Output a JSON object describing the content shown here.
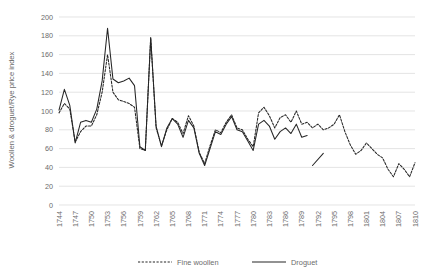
{
  "chart_data": {
    "type": "line",
    "title": "",
    "xlabel": "",
    "ylabel": "Woollen & droguet/Rye price index",
    "ylim": [
      0,
      200
    ],
    "ytick_step": 20,
    "yticks": [
      "0",
      "20",
      "40",
      "60",
      "80",
      "100",
      "120",
      "140",
      "160",
      "180",
      "200"
    ],
    "grid": true,
    "xlim": [
      1744,
      1810
    ],
    "xtick_step": 3,
    "xticks": [
      "1744",
      "1747",
      "1750",
      "1753",
      "1756",
      "1759",
      "1762",
      "1765",
      "1768",
      "1771",
      "1774",
      "1777",
      "1780",
      "1783",
      "1786",
      "1789",
      "1792",
      "1795",
      "1798",
      "1801",
      "1804",
      "1807",
      "1810"
    ],
    "legend_position": "bottom",
    "legend": [
      "Fine woollen",
      "Droguet"
    ],
    "series": [
      {
        "name": "Fine woollen",
        "style": "dashed",
        "color": "#262626",
        "x": [
          1744,
          1745,
          1746,
          1747,
          1748,
          1749,
          1750,
          1751,
          1752,
          1753,
          1754,
          1755,
          1756,
          1757,
          1758,
          1759,
          1760,
          1761,
          1762,
          1763,
          1764,
          1765,
          1766,
          1767,
          1768,
          1769,
          1770,
          1771,
          1772,
          1773,
          1774,
          1775,
          1776,
          1777,
          1778,
          1779,
          1780,
          1781,
          1782,
          1783,
          1784,
          1785,
          1786,
          1787,
          1788,
          1789,
          1790,
          1791,
          1792,
          1793,
          1794,
          1795,
          1796,
          1797,
          1798,
          1799,
          1800,
          1801,
          1802,
          1803,
          1804,
          1805,
          1806,
          1807,
          1808,
          1809,
          1810
        ],
        "values": [
          98,
          108,
          102,
          67,
          78,
          84,
          84,
          96,
          120,
          160,
          120,
          112,
          110,
          108,
          104,
          60,
          58,
          178,
          82,
          63,
          80,
          92,
          88,
          76,
          95,
          84,
          56,
          44,
          63,
          80,
          77,
          88,
          96,
          82,
          80,
          70,
          62,
          98,
          104,
          95,
          82,
          93,
          96,
          88,
          100,
          86,
          88,
          82,
          86,
          80,
          82,
          86,
          96,
          78,
          64,
          54,
          58,
          66,
          60,
          54,
          50,
          38,
          30,
          44,
          38,
          30,
          45
        ]
      },
      {
        "name": "Droguet",
        "style": "solid",
        "color": "#262626",
        "x": [
          1744,
          1745,
          1746,
          1747,
          1748,
          1749,
          1750,
          1751,
          1752,
          1753,
          1754,
          1755,
          1756,
          1757,
          1758,
          1759,
          1760,
          1761,
          1762,
          1763,
          1764,
          1765,
          1766,
          1767,
          1768,
          1769,
          1770,
          1771,
          1772,
          1773,
          1774,
          1775,
          1776,
          1777,
          1778,
          1779,
          1780,
          1781,
          1782,
          1783,
          1784,
          1785,
          1786,
          1787,
          1788,
          1789,
          1790
        ],
        "values": [
          101,
          123,
          106,
          66,
          88,
          90,
          88,
          102,
          132,
          188,
          134,
          130,
          132,
          135,
          127,
          62,
          58,
          178,
          84,
          62,
          82,
          92,
          86,
          72,
          90,
          82,
          55,
          42,
          60,
          78,
          75,
          86,
          94,
          80,
          78,
          68,
          58,
          86,
          90,
          84,
          70,
          78,
          82,
          76,
          86,
          72,
          74
        ],
        "gap_after": 1789,
        "post_gap_segment": {
          "x": [
            1791,
            1793
          ],
          "values": [
            42,
            55
          ]
        }
      }
    ]
  },
  "axis": {
    "y_title": "Woollen & droguet/Rye price index"
  },
  "legend_items": [
    {
      "label": "Fine woollen",
      "style": "dashed"
    },
    {
      "label": "Droguet",
      "style": "solid"
    }
  ]
}
